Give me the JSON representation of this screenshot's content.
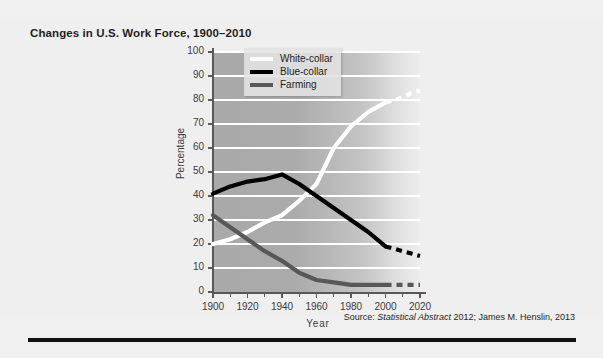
{
  "title": "Changes in U.S. Work Force, 1900–2010",
  "source": {
    "prefix": "Source:",
    "italic": "Statistical Abstract",
    "rest": "2012; James M. Henslin, 2013"
  },
  "legend": [
    {
      "label": "White-collar",
      "color": "#ffffff"
    },
    {
      "label": "Blue-collar",
      "color": "#000000"
    },
    {
      "label": "Farming",
      "color": "#58585a"
    }
  ],
  "chart_data": {
    "type": "line",
    "title": "Changes in U.S. Work Force, 1900–2010",
    "xlabel": "Year",
    "ylabel": "Percentage",
    "xlim": [
      1900,
      2020
    ],
    "ylim": [
      0,
      100
    ],
    "xticks": [
      1900,
      1920,
      1940,
      1960,
      1980,
      2000,
      2020
    ],
    "yticks": [
      0,
      10,
      20,
      30,
      40,
      50,
      60,
      70,
      80,
      90,
      100
    ],
    "grid": true,
    "legend_position": "top-left-inside",
    "series": [
      {
        "name": "White-collar",
        "color": "#ffffff",
        "x": [
          1900,
          1910,
          1920,
          1930,
          1940,
          1950,
          1960,
          1970,
          1980,
          1990,
          2000
        ],
        "values": [
          20,
          22,
          25,
          29,
          32,
          38,
          45,
          60,
          69,
          75,
          79
        ],
        "projection": {
          "style": "dashed",
          "x": [
            2000,
            2005,
            2010,
            2015,
            2020
          ],
          "values": [
            79,
            80,
            81,
            83,
            84
          ]
        }
      },
      {
        "name": "Blue-collar",
        "color": "#000000",
        "x": [
          1900,
          1910,
          1920,
          1930,
          1940,
          1950,
          1960,
          1970,
          1980,
          1990,
          2000
        ],
        "values": [
          41,
          44,
          46,
          47,
          49,
          45,
          40,
          35,
          30,
          25,
          19
        ],
        "projection": {
          "style": "dashed",
          "x": [
            2000,
            2005,
            2010,
            2015,
            2020
          ],
          "values": [
            19,
            18,
            17,
            16,
            15
          ]
        }
      },
      {
        "name": "Farming",
        "color": "#58585a",
        "x": [
          1900,
          1910,
          1920,
          1930,
          1940,
          1950,
          1960,
          1970,
          1980,
          1990,
          2000
        ],
        "values": [
          32,
          27,
          22,
          17,
          13,
          8,
          5,
          4,
          3,
          3,
          3
        ],
        "projection": {
          "style": "dashed",
          "x": [
            2000,
            2005,
            2010,
            2015,
            2020
          ],
          "values": [
            3,
            3,
            3,
            3,
            3
          ]
        }
      }
    ]
  }
}
